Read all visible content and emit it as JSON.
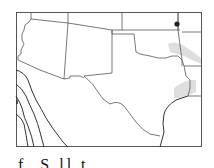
{
  "map": {
    "region": "Southwestern United States",
    "states_shown": [
      "Arizona",
      "New Mexico",
      "Texas",
      "Oklahoma",
      "Kansas",
      "Colorado",
      "Utah",
      "Arkansas",
      "Louisiana"
    ],
    "frame_color": "#555555",
    "border_color": "#555555",
    "contour_color": "#333333",
    "shade_color": "#d6d6d6",
    "marker": {
      "symbol": "dot",
      "color": "#222222",
      "location": "northeastern Oklahoma / Kansas border"
    },
    "shaded_areas": [
      {
        "location": "eastern Oklahoma"
      },
      {
        "location": "eastern Texas"
      }
    ],
    "contour_lines": 4
  },
  "caption": {
    "text": "f. S          ll     t"
  }
}
